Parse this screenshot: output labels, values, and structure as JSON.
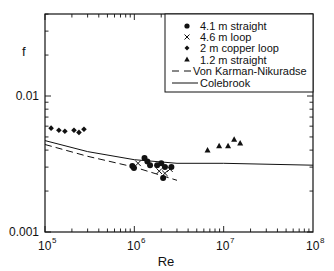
{
  "chart_data": {
    "type": "scatter",
    "title": "",
    "xlabel": "Re",
    "ylabel": "f",
    "xscale": "log",
    "yscale": "log",
    "xlim": [
      100000,
      100000000
    ],
    "ylim": [
      0.001,
      0.04
    ],
    "x_ticks": [
      {
        "value": 100000,
        "base": "10",
        "exp": "5"
      },
      {
        "value": 1000000,
        "base": "10",
        "exp": "6"
      },
      {
        "value": 10000000,
        "base": "10",
        "exp": "7"
      },
      {
        "value": 100000000,
        "base": "10",
        "exp": "8"
      }
    ],
    "y_ticks": [
      {
        "value": 0.001,
        "label": "0.001"
      },
      {
        "value": 0.01,
        "label": "0.01"
      }
    ],
    "grid": false,
    "legend_position": "upper right",
    "series": [
      {
        "name": "4.1 m straight",
        "marker": "circle",
        "points": [
          [
            950000,
            0.00306
          ],
          [
            990000,
            0.00295
          ],
          [
            1300000,
            0.0035
          ],
          [
            1400000,
            0.0033
          ],
          [
            1500000,
            0.0031
          ],
          [
            1800000,
            0.0031
          ],
          [
            2000000,
            0.0032
          ],
          [
            2200000,
            0.003
          ],
          [
            2100000,
            0.0025
          ],
          [
            2600000,
            0.003
          ]
        ]
      },
      {
        "name": "4.6 m loop",
        "marker": "x",
        "points": [
          [
            1100000,
            0.0032
          ],
          [
            1900000,
            0.0028
          ],
          [
            2200000,
            0.0027
          ],
          [
            2500000,
            0.0029
          ]
        ]
      },
      {
        "name": "2 m copper loop",
        "marker": "diamond",
        "points": [
          [
            117000,
            0.0058
          ],
          [
            143000,
            0.0056
          ],
          [
            167000,
            0.0055
          ],
          [
            211000,
            0.0056
          ],
          [
            240000,
            0.0054
          ],
          [
            273000,
            0.0057
          ]
        ]
      },
      {
        "name": "1.2 m straight",
        "marker": "triangle",
        "points": [
          [
            6600000,
            0.004
          ],
          [
            8900000,
            0.0043
          ],
          [
            11200000,
            0.0043
          ],
          [
            13100000,
            0.0048
          ],
          [
            15300000,
            0.0045
          ]
        ]
      },
      {
        "name": "Von Karman-Nikuradse",
        "line": "dashed",
        "points": [
          [
            100000,
            0.0044
          ],
          [
            300000,
            0.0036
          ],
          [
            1000000,
            0.003
          ],
          [
            3000000,
            0.0024
          ]
        ]
      },
      {
        "name": "Colebrook",
        "line": "solid",
        "points": [
          [
            100000,
            0.0047
          ],
          [
            300000,
            0.0039
          ],
          [
            1000000,
            0.0034
          ],
          [
            3000000,
            0.0032
          ],
          [
            10000000,
            0.0032
          ],
          [
            100000000,
            0.0031
          ]
        ]
      }
    ]
  },
  "legend": {
    "items": [
      {
        "label": "4.1 m straight"
      },
      {
        "label": "4.6 m loop"
      },
      {
        "label": "2 m copper loop"
      },
      {
        "label": "1.2 m straight"
      },
      {
        "label": "Von Karman-Nikuradse"
      },
      {
        "label": "Colebrook"
      }
    ]
  },
  "axes": {
    "x_label": "Re",
    "y_label": "f",
    "y_tick_labels": [
      "0.001",
      "0.01"
    ],
    "x_tick_base": "10",
    "x_tick_exps": [
      "5",
      "6",
      "7",
      "8"
    ]
  },
  "colors": {
    "ink": "#111111",
    "background": "#ffffff"
  }
}
